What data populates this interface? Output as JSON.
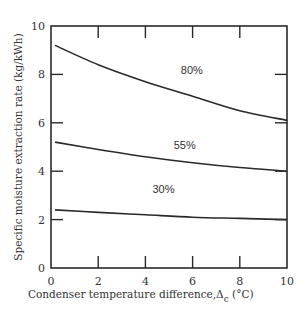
{
  "chart_data": {
    "type": "line",
    "title": "",
    "xlabel": "Condenser temperature difference,Δ",
    "xlabel_subscript": "c",
    "xlabel_unit": " (°C)",
    "ylabel": "Specific moisture extraction rate (kg/kWh)",
    "xlim": [
      0,
      10
    ],
    "ylim": [
      0,
      10
    ],
    "x_ticks": [
      0,
      2,
      4,
      6,
      8,
      10
    ],
    "y_ticks": [
      0,
      2,
      4,
      6,
      8,
      10
    ],
    "grid": false,
    "legend": "inline labels",
    "x": [
      0,
      2,
      4,
      6,
      8,
      10
    ],
    "series": [
      {
        "name": "80%",
        "values": [
          9.2,
          8.4,
          7.7,
          7.1,
          6.5,
          6.1
        ],
        "label_pos": [
          5.5,
          8.0
        ]
      },
      {
        "name": "55%",
        "values": [
          5.2,
          4.9,
          4.6,
          4.35,
          4.15,
          4.0
        ],
        "label_pos": [
          5.2,
          4.9
        ]
      },
      {
        "name": "30%",
        "values": [
          2.4,
          2.3,
          2.2,
          2.1,
          2.05,
          2.0
        ],
        "label_pos": [
          4.3,
          3.1
        ]
      }
    ]
  }
}
